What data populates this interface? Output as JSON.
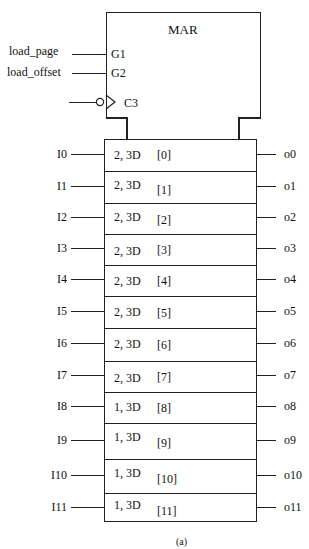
{
  "title": "MAR",
  "control_inputs": [
    {
      "signal": "load_page",
      "pin": "G1"
    },
    {
      "signal": "load_offset",
      "pin": "G2"
    },
    {
      "signal": "",
      "pin": "C3",
      "clock": true,
      "inverted": true
    }
  ],
  "rows": [
    {
      "input": "I0",
      "dep": "2, 3D",
      "index": "[0]",
      "output": "o0"
    },
    {
      "input": "I1",
      "dep": "2, 3D",
      "index": "[1]",
      "output": "o1"
    },
    {
      "input": "I2",
      "dep": "2, 3D",
      "index": "[2]",
      "output": "o2"
    },
    {
      "input": "I3",
      "dep": "2, 3D",
      "index": "[3]",
      "output": "o3"
    },
    {
      "input": "I4",
      "dep": "2, 3D",
      "index": "[4]",
      "output": "o4"
    },
    {
      "input": "I5",
      "dep": "2, 3D",
      "index": "[5]",
      "output": "o5"
    },
    {
      "input": "I6",
      "dep": "2, 3D",
      "index": "[6]",
      "output": "o6"
    },
    {
      "input": "I7",
      "dep": "2, 3D",
      "index": "[7]",
      "output": "o7"
    },
    {
      "input": "I8",
      "dep": "1, 3D",
      "index": "[8]",
      "output": "o8"
    },
    {
      "input": "I9",
      "dep": "1, 3D",
      "index": "[9]",
      "output": "o9"
    },
    {
      "input": "I10",
      "dep": "1, 3D",
      "index": "[10]",
      "output": "o10"
    },
    {
      "input": "I11",
      "dep": "1, 3D",
      "index": "[11]",
      "output": "o11"
    }
  ],
  "caption": "(a)"
}
